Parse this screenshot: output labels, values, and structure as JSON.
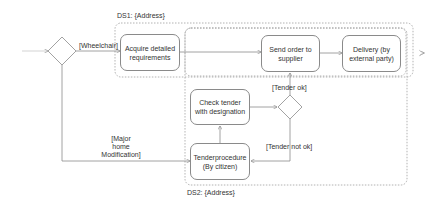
{
  "diagram": {
    "type": "activity",
    "partitions": {
      "ds1": {
        "label": "DS1: {Address}"
      },
      "ds2": {
        "label": "DS2: {Address}"
      }
    },
    "nodes": {
      "acquire": {
        "label": "Acquire detailed requirements"
      },
      "send_order": {
        "label": "Send order to supplier"
      },
      "delivery": {
        "label": "Delivery (by external party)"
      },
      "check_tender": {
        "label": "Check tender with designation"
      },
      "tenderprocedure": {
        "label": "Tenderprocedure (By citizen)"
      }
    },
    "guards": {
      "wheelchair": "[Wheelchair]",
      "major_line1": "[Major",
      "major_line2": "home",
      "major_line3": "Modification]",
      "tender_ok": "[Tender ok]",
      "tender_not_ok": "[Tender not ok]"
    },
    "colors": {
      "line": "#8a8a8a",
      "dashed": "#a0a0a0",
      "text": "#333333"
    }
  }
}
